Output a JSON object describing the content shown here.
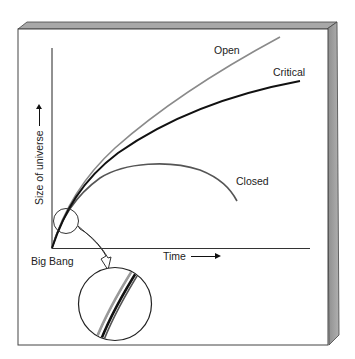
{
  "diagram": {
    "title": "",
    "axes": {
      "y_label": "Size of universe",
      "x_label": "Time",
      "origin_label": "Big Bang"
    },
    "curves": [
      {
        "name": "Open",
        "label": "Open",
        "color": "#8a8a8a"
      },
      {
        "name": "Critical",
        "label": "Critical",
        "color": "#111111"
      },
      {
        "name": "Closed",
        "label": "Closed",
        "color": "#555555"
      }
    ],
    "inset": {
      "description": "Magnified view of curves near the Big Bang showing they are nearly indistinguishable"
    },
    "colors": {
      "panel_side": "#9a9a9a",
      "panel_top": "#a8a8a8",
      "panel_border": "#333333",
      "axis": "#222222"
    }
  }
}
